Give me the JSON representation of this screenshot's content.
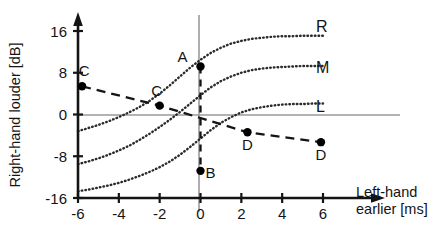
{
  "chart_data": {
    "type": "line",
    "title": "",
    "xlabel": "Left-hand earlier  [ms]",
    "ylabel": "Right-hand louder  [dB]",
    "xlim": [
      -6.6,
      7.0
    ],
    "ylim": [
      -17.5,
      18.5
    ],
    "xticks": [
      -6,
      -4,
      -2,
      0,
      2,
      4,
      6
    ],
    "xticklabels": [
      "-6",
      "-4",
      "-2",
      "0",
      "2",
      "4",
      "6"
    ],
    "yticks": [
      -16,
      -8,
      0,
      8,
      16
    ],
    "yticklabels": [
      "-16",
      "-8",
      "0",
      "8",
      "16"
    ],
    "grid": false,
    "legend_position": "right-inline",
    "series": [
      {
        "name": "R",
        "label": "R",
        "style": "dotted",
        "x": [
          -6.0,
          -5.5,
          -5.0,
          -4.5,
          -4.0,
          -3.5,
          -3.0,
          -2.5,
          -2.0,
          -1.5,
          -1.0,
          -0.5,
          0.0,
          0.5,
          1.0,
          1.5,
          2.0,
          2.5,
          3.0,
          3.5,
          4.0,
          4.5,
          5.0,
          5.5,
          6.0
        ],
        "y": [
          -3.2,
          -2.6,
          -2.0,
          -1.3,
          -0.5,
          0.4,
          1.4,
          2.6,
          4.0,
          5.6,
          7.3,
          9.0,
          10.5,
          11.8,
          12.8,
          13.6,
          14.1,
          14.5,
          14.7,
          14.9,
          15.0,
          15.0,
          15.1,
          15.1,
          15.1
        ]
      },
      {
        "name": "M",
        "label": "M",
        "style": "dotted",
        "x": [
          -6.0,
          -5.5,
          -5.0,
          -4.5,
          -4.0,
          -3.5,
          -3.0,
          -2.5,
          -2.0,
          -1.5,
          -1.0,
          -0.5,
          0.0,
          0.5,
          1.0,
          1.5,
          2.0,
          2.5,
          3.0,
          3.5,
          4.0,
          4.5,
          5.0,
          5.5,
          6.0
        ],
        "y": [
          -9.5,
          -9.0,
          -8.4,
          -7.7,
          -6.9,
          -6.0,
          -4.9,
          -3.7,
          -2.4,
          -1.0,
          0.5,
          2.1,
          3.7,
          5.2,
          6.4,
          7.3,
          8.0,
          8.5,
          8.8,
          9.0,
          9.1,
          9.2,
          9.3,
          9.3,
          9.3
        ]
      },
      {
        "name": "L",
        "label": "L",
        "style": "dotted",
        "x": [
          -6.0,
          -5.5,
          -5.0,
          -4.5,
          -4.0,
          -3.5,
          -3.0,
          -2.5,
          -2.0,
          -1.5,
          -1.0,
          -0.5,
          0.0,
          0.5,
          1.0,
          1.5,
          2.0,
          2.5,
          3.0,
          3.5,
          4.0,
          4.5,
          5.0,
          5.5,
          6.0
        ],
        "y": [
          -14.7,
          -14.4,
          -14.0,
          -13.6,
          -13.1,
          -12.5,
          -11.8,
          -11.0,
          -10.1,
          -9.0,
          -7.7,
          -6.2,
          -4.6,
          -3.0,
          -1.6,
          -0.5,
          0.4,
          1.0,
          1.4,
          1.7,
          1.9,
          2.0,
          2.0,
          2.1,
          2.1
        ]
      },
      {
        "name": "trade-off",
        "label": "",
        "style": "dashed",
        "x": [
          -5.8,
          -2.0,
          2.3,
          5.9
        ],
        "y": [
          5.4,
          1.7,
          -3.4,
          -5.3
        ]
      },
      {
        "name": "vertical-dashed",
        "label": "",
        "style": "dashed-vertical",
        "x": [
          0.0,
          0.0
        ],
        "y": [
          9.2,
          -10.8
        ]
      }
    ],
    "points": [
      {
        "label": "A",
        "x": 0.0,
        "y": 9.2,
        "label_pos": "left"
      },
      {
        "label": "B",
        "x": 0.0,
        "y": -10.8,
        "label_pos": "right"
      },
      {
        "label": "C",
        "x": -5.8,
        "y": 5.4,
        "label_pos": "above-right"
      },
      {
        "label": "C",
        "x": -2.0,
        "y": 1.7,
        "label_pos": "above"
      },
      {
        "label": "D",
        "x": 2.3,
        "y": -3.4,
        "label_pos": "below"
      },
      {
        "label": "D",
        "x": 5.9,
        "y": -5.3,
        "label_pos": "below"
      }
    ],
    "colors": {
      "axis": "#141414",
      "curve": "#2b2b2b",
      "dashed": "#141414",
      "point": "#000000",
      "zero_line": "#9a9a9a",
      "background": "#ffffff"
    }
  }
}
